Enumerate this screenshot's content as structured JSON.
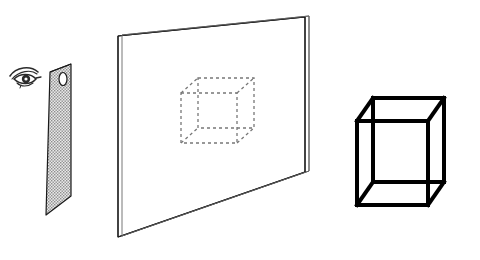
{
  "figure": {
    "background_color": "#ffffff",
    "ink_color": "#1a1a1a",
    "width": 480,
    "height": 260
  },
  "observer": {
    "label": "eye",
    "icon": "eye-icon",
    "description": "side-view eye symbol facing right",
    "color": "#2b2b2b",
    "position": {
      "x": 8,
      "y": 62,
      "width": 34,
      "height": 26
    }
  },
  "aperture_panel": {
    "label": "screen with aperture",
    "description": "tall narrow stippled panel in oblique projection with a small oval hole near the top",
    "fill_pattern": "stipple",
    "fill_color": "#b4b4b4",
    "outline_color": "#1a1a1a",
    "corners": [
      {
        "x": 50,
        "y": 72
      },
      {
        "x": 71,
        "y": 64
      },
      {
        "x": 71,
        "y": 196
      },
      {
        "x": 46,
        "y": 215
      }
    ],
    "hole": {
      "name": "aperture-hole",
      "shape": "oval",
      "center": {
        "x": 63,
        "y": 79
      },
      "rx": 4,
      "ry": 6.5
    }
  },
  "projection_screen": {
    "label": "projection screen",
    "description": "large planar white screen drawn as a thin slab with a double outline",
    "face_color": "#ffffff",
    "outline_color": "#1a1a1a",
    "edge_color": "#555555",
    "corners": [
      {
        "x": 118,
        "y": 36
      },
      {
        "x": 305,
        "y": 17
      },
      {
        "x": 305,
        "y": 172
      },
      {
        "x": 118,
        "y": 237
      }
    ],
    "slab_thickness_px": 4
  },
  "projected_cube": {
    "label": "projected cube image",
    "description": "dashed outline of a cube drawn on the screen surface",
    "stroke_color": "#777777",
    "stroke_style": "dashed",
    "dash_pattern": "3 3",
    "front_face": {
      "x": 181,
      "y": 93,
      "width": 56,
      "height": 50
    },
    "depth_offset": {
      "dx": 17,
      "dy": -15
    }
  },
  "solid_cube": {
    "label": "cube object",
    "description": "solid black wireframe cube, all twelve edges visible",
    "stroke_color": "#000000",
    "stroke_width": 4,
    "front_face": {
      "x": 357,
      "y": 121,
      "width": 71,
      "height": 84
    },
    "depth_offset": {
      "dx": 16,
      "dy": -23
    }
  },
  "elements": [
    {
      "name": "eye-icon",
      "type": "icon"
    },
    {
      "name": "aperture-panel",
      "type": "shape"
    },
    {
      "name": "aperture-hole",
      "type": "shape"
    },
    {
      "name": "projection-screen",
      "type": "shape"
    },
    {
      "name": "projected-cube",
      "type": "shape"
    },
    {
      "name": "solid-cube",
      "type": "shape"
    }
  ]
}
